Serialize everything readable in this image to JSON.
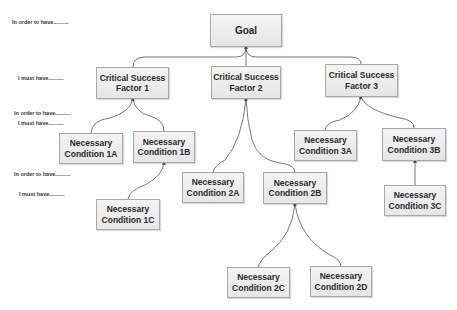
{
  "side_labels": [
    {
      "text": "In order to have..........",
      "x": 12,
      "y": 19
    },
    {
      "text": "I must have..........",
      "x": 18,
      "y": 75
    },
    {
      "text": "In order to have..........",
      "x": 14,
      "y": 110
    },
    {
      "text": "I must have..........",
      "x": 18,
      "y": 120
    },
    {
      "text": "In order to have..........",
      "x": 14,
      "y": 171
    },
    {
      "text": "I must have..........",
      "x": 19,
      "y": 191
    }
  ],
  "nodes": {
    "goal": {
      "line1": "Goal",
      "line2": ""
    },
    "csf1": {
      "line1": "Critical Success",
      "line2": "Factor 1"
    },
    "csf2": {
      "line1": "Critical Success",
      "line2": "Factor 2"
    },
    "csf3": {
      "line1": "Critical Success",
      "line2": "Factor 3"
    },
    "nc1a": {
      "line1": "Necessary",
      "line2": "Condition 1A"
    },
    "nc1b": {
      "line1": "Necessary",
      "line2": "Condition 1B"
    },
    "nc1c": {
      "line1": "Necessary",
      "line2": "Condition 1C"
    },
    "nc2a": {
      "line1": "Necessary",
      "line2": "Condition 2A"
    },
    "nc2b": {
      "line1": "Necessary",
      "line2": "Condition 2B"
    },
    "nc2c": {
      "line1": "Necessary",
      "line2": "Condition 2C"
    },
    "nc2d": {
      "line1": "Necessary",
      "line2": "Condition 2D"
    },
    "nc3a": {
      "line1": "Necessary",
      "line2": "Condition 3A"
    },
    "nc3b": {
      "line1": "Necessary",
      "line2": "Condition 3B"
    },
    "nc3c": {
      "line1": "Necessary",
      "line2": "Condition 3C"
    }
  },
  "colors": {
    "node_border": "#a8a8a8",
    "node_fill": "#ececec",
    "connector": "#555555",
    "text": "#2a2a2a"
  }
}
